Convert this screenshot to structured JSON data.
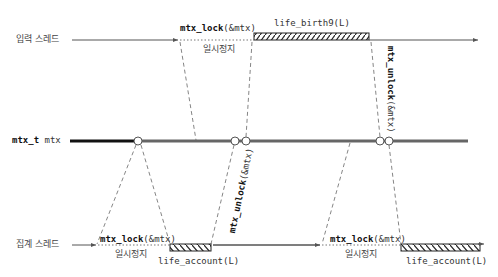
{
  "rows": {
    "input_thread": {
      "label": "입력 스레드"
    },
    "mutex": {
      "label_type": "mtx_t",
      "label_name": "mtx"
    },
    "aggregate_thread": {
      "label": "집계 스레드"
    }
  },
  "top": {
    "lock_call_fn": "mtx_lock",
    "lock_call_arg": "(&mtx)",
    "pause_label": "일시정지",
    "work_label": "life_birth9(L)",
    "unlock_call_fn": "mtx_unlock",
    "unlock_call_arg": "(&mtx)"
  },
  "bottom": {
    "lock1_fn": "mtx_lock",
    "lock1_arg": "(&mtx)",
    "pause1_label": "일시정지",
    "work1_label": "life_account(L)",
    "unlock_fn": "mtx_unlock",
    "unlock_arg": "(&mtx)",
    "lock2_fn": "mtx_lock",
    "lock2_arg": "(&mtx)",
    "pause2_label": "일시정지",
    "work2_label": "life_account(L)"
  },
  "colors": {
    "line": "#555555",
    "mutex_dark": "#111111",
    "mutex_gray": "#666666",
    "dash": "#666666"
  }
}
